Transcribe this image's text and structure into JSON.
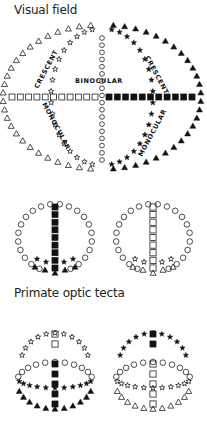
{
  "sections": {
    "visual_field": {
      "title": "Visual field"
    },
    "primate_tecta": {
      "title": "Primate optic tecta"
    }
  },
  "visual_field_labels": {
    "binocular": "BINOCULAR",
    "crescent_left": "CRESCENT",
    "crescent_right": "CRESCENT",
    "monocular_left": "MONOCULAR",
    "monocular_right": "MONOCULAR"
  },
  "legend_symbols": {
    "open_triangle": "left monocular crescent (outer)",
    "open_star": "left binocular edge",
    "open_circle": "vertical meridian",
    "open_square": "left horizontal meridian",
    "filled_square": "right horizontal meridian",
    "filled_star": "right binocular edge",
    "filled_triangle": "right monocular crescent (outer)"
  },
  "colors": {
    "ink": "#111111",
    "open_ink": "#333333",
    "background": "#ffffff"
  }
}
